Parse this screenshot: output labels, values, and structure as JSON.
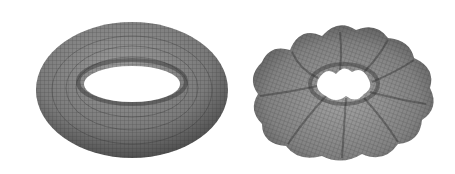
{
  "figure": {
    "panels": [
      {
        "id": "smooth-torus",
        "shape": "torus",
        "lobes": 0,
        "fill": "#7a7a7a",
        "mesh": "#2e2e2e"
      },
      {
        "id": "wavy-torus",
        "shape": "undulating torus",
        "lobes": 9,
        "fill": "#808080",
        "mesh": "#2e2e2e"
      }
    ],
    "background": "#ffffff"
  }
}
